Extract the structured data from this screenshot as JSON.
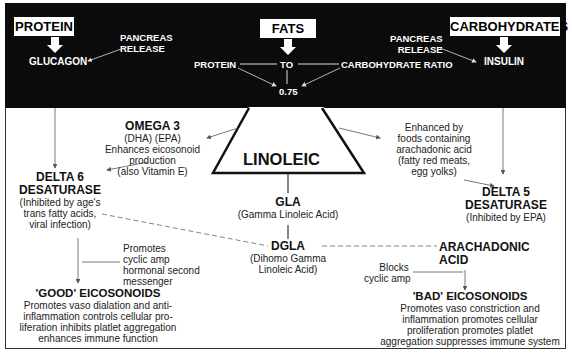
{
  "top_section": {
    "inputs": [
      {
        "label": "PROTEIN",
        "hormone": "GLUCAGON"
      },
      {
        "label": "FATS"
      },
      {
        "label": "CARBOHYDRATES",
        "hormone": "INSULIN"
      }
    ],
    "pancreas_left": [
      "PANCREAS",
      "RELEASE"
    ],
    "pancreas_right": [
      "PANCREAS",
      "RELEASE"
    ],
    "ratio": {
      "left": "PROTEIN",
      "middle": "TO",
      "right": "CARBOHYDRATE RATIO",
      "value": "0.75"
    }
  },
  "center": {
    "triangle_label": "LINOLEIC",
    "gla": {
      "title": "GLA",
      "desc": "(Gamma Linoleic Acid)"
    },
    "dgla": {
      "title": "DGLA",
      "desc": [
        "(Dihomo Gamma",
        "Linoleic Acid)"
      ]
    }
  },
  "omega3": {
    "title": "OMEGA 3",
    "lines": [
      "(DHA) (EPA)",
      "Enhances eicosonoid",
      "production",
      "(also Vitamin E)"
    ]
  },
  "enhanced": {
    "lines": [
      "Enhanced by",
      "foods containing",
      "arachadonic acid",
      "(fatty red meats,",
      "egg yolks)"
    ]
  },
  "delta6": {
    "title": [
      "DELTA 6",
      "DESATURASE"
    ],
    "lines": [
      "(Inhibited by age's",
      "trans fatty acids,",
      "viral infection)"
    ]
  },
  "delta5": {
    "title": [
      "DELTA 5",
      "DESATURASE"
    ],
    "lines": [
      "(Inhibited by EPA)"
    ]
  },
  "arachadonic": {
    "title": [
      "ARACHADONIC",
      "ACID"
    ]
  },
  "promotes_note": {
    "lines": [
      "Promotes",
      "cyclic amp",
      "hormonal second",
      "messenger"
    ]
  },
  "blocks_note": {
    "lines": [
      "Blocks",
      "cyclic amp"
    ]
  },
  "good": {
    "title": "'GOOD' EICOSONOIDS",
    "lines": [
      "Promotes vaso dialation and anti-",
      "inflammation controls cellular pro-",
      "liferation inhibits platlet aggregation",
      "enhances immune function"
    ]
  },
  "bad": {
    "title": "'BAD' EICOSONOIDS",
    "lines": [
      "Promotes vaso constriction and",
      "inflammation promotes cellular",
      "proliferation promotes platlet",
      "aggregation suppresses immune system"
    ]
  }
}
